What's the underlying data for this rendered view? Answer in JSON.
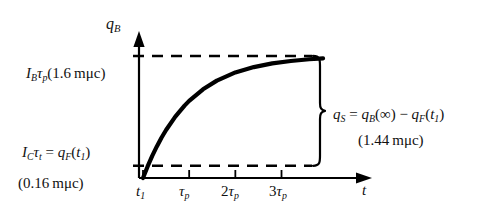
{
  "figure": {
    "background_color": "#ffffff",
    "ink_color": "#000000",
    "axes": {
      "y_title": "q_B",
      "x_title": "t"
    },
    "labels": {
      "upper_left": {
        "symbol_main": "I",
        "symbol_sub": "B",
        "symbol_tau": "τ",
        "tau_sub": "p",
        "value_text": "(1.6 mμc)",
        "full_text": "I_Bτ_p(1.6 mμc)"
      },
      "lower_left": {
        "lhs_main": "I",
        "lhs_sub": "C",
        "lhs_tau": "τ",
        "lhs_tau_sub": "t",
        "equals": "=",
        "rhs_main": "q",
        "rhs_sub": "F",
        "rhs_arg": "(t",
        "rhs_arg_sub": "1",
        "rhs_close": ")",
        "value_text": "(0.16 mμc)",
        "full_text": "I_Cτ_t = q_F(t_1)"
      },
      "brace": {
        "expression_text": "q_S = q_B(∞) − q_F(t_1)",
        "value_text": "(1.44 mμc)",
        "q_symbol": "q",
        "s_sub": "S",
        "equals": "=",
        "b_sub": "B",
        "infinity": "(∞)",
        "minus": "−",
        "f_sub": "F",
        "t_arg": "(t",
        "t_sub": "1",
        "t_close": ")"
      }
    },
    "x_ticks": [
      {
        "id": "t1",
        "label_main": "t",
        "label_sub": "1",
        "prefix": "",
        "value": 0.0
      },
      {
        "id": "tau_p",
        "label_main": "τ",
        "label_sub": "p",
        "prefix": "",
        "value": 1.0
      },
      {
        "id": "2tau_p",
        "label_main": "τ",
        "label_sub": "p",
        "prefix": "2",
        "value": 2.0
      },
      {
        "id": "3tau_p",
        "label_main": "τ",
        "label_sub": "p",
        "prefix": "3",
        "value": 3.0
      }
    ]
  },
  "chart_data": {
    "type": "line",
    "title": "",
    "xlabel": "t",
    "ylabel": "q_B",
    "grid": false,
    "legend": false,
    "xlim": [
      0,
      4.7
    ],
    "ylim": [
      0,
      1.18
    ],
    "x_tick_values": [
      0,
      1,
      2,
      3
    ],
    "x_tick_labels": [
      "t_1",
      "τ_p",
      "2τ_p",
      "3τ_p"
    ],
    "y_tick_values": [
      0.1,
      1.0
    ],
    "y_tick_labels": [
      "I_Cτ_t = q_F(t_1)  (0.16 mμc)",
      "I_Bτ_p(1.6 mμc)"
    ],
    "series": [
      {
        "name": "q_B(t)",
        "description": "exponential saturation q_B(t) = q_B(∞)(1 - e^(-t/τ_p))",
        "x": [
          0,
          0.1,
          0.2,
          0.3,
          0.4,
          0.5,
          0.7,
          0.9,
          1.0,
          1.3,
          1.6,
          2.0,
          2.4,
          2.8,
          3.2,
          3.6,
          3.9
        ],
        "y": [
          0.0,
          0.095,
          0.181,
          0.259,
          0.33,
          0.393,
          0.503,
          0.593,
          0.632,
          0.727,
          0.798,
          0.865,
          0.909,
          0.939,
          0.959,
          0.973,
          0.98
        ]
      }
    ],
    "reference_lines": [
      {
        "name": "q_B(∞)",
        "axis": "y",
        "value": 1.0,
        "style": "dashed",
        "label": "I_Bτ_p(1.6 mμc)"
      },
      {
        "name": "q_F(t_1)",
        "axis": "y",
        "value": 0.1,
        "style": "dashed",
        "label": "I_Cτ_t = q_F(t_1)"
      }
    ],
    "annotations": [
      {
        "name": "brace-annotation",
        "type": "curly-brace",
        "spans_y": [
          0.1,
          1.0
        ],
        "text": "q_S = q_B(∞) - q_F(t_1)",
        "value": "(1.44 mμc)"
      }
    ],
    "values_summary": {
      "q_B_infinity_m_microcoulomb": 1.6,
      "q_F_t1_m_microcoulomb": 0.16,
      "q_S_m_microcoulomb": 1.44
    }
  }
}
